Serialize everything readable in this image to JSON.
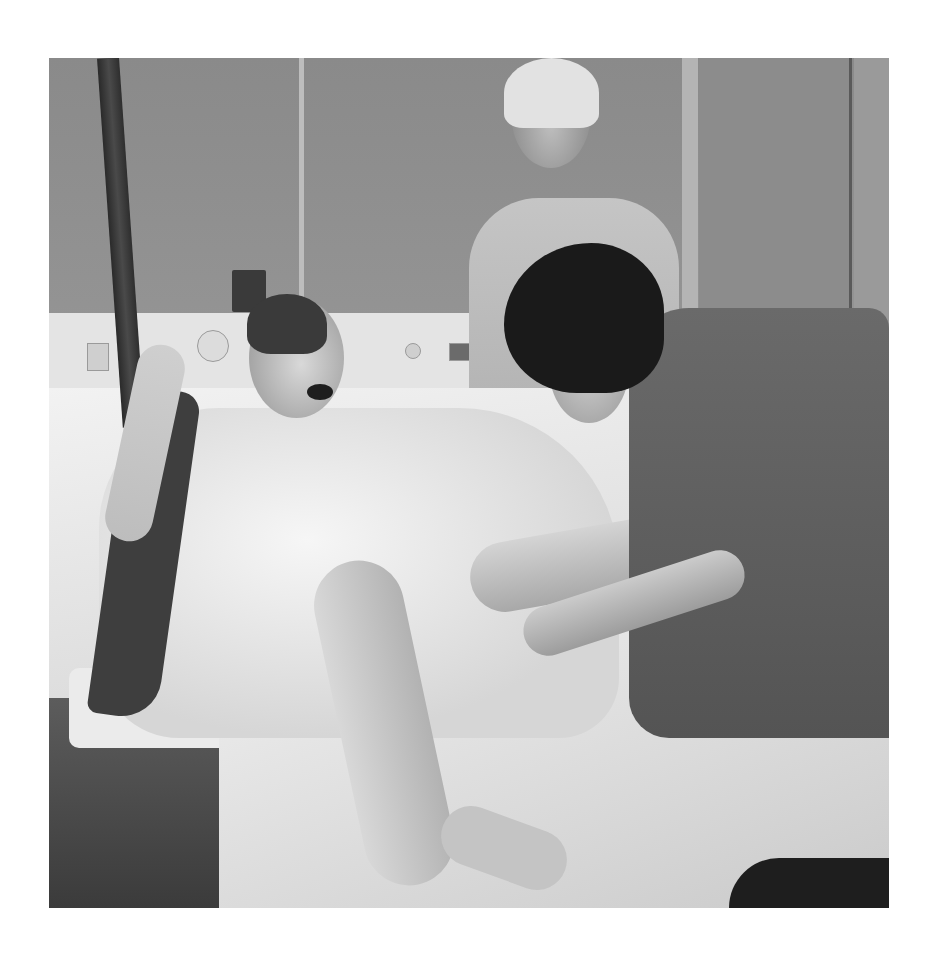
{
  "image": {
    "description": "Grayscale photograph of a hospital delivery room: a woman in a patterned hospital gown lies on a bed gripping an overhead birthing sling, mouth open; a nurse in dark scrubs tends to her feet while a standing attendant in light scrubs watches.",
    "palette": {
      "background": "#ffffff",
      "wall": "#8d8d8d",
      "gown": "#e8e8e8",
      "scrubs_dark": "#5e5e5e",
      "hair_dark": "#1a1a1a"
    },
    "frame": {
      "left": 49,
      "top": 58,
      "width": 840,
      "height": 850
    }
  }
}
